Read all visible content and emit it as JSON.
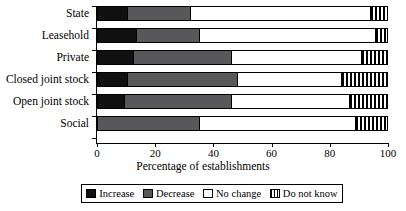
{
  "chart_data": {
    "type": "bar",
    "orientation": "horizontal",
    "stacked": true,
    "normalized": true,
    "title": "",
    "xlabel": "Percentage of establishments",
    "ylabel": "",
    "xlim": [
      0,
      100
    ],
    "xticks": [
      0,
      20,
      40,
      60,
      80,
      100
    ],
    "grid": false,
    "legend_position": "bottom",
    "categories": [
      "State",
      "Leasehold",
      "Private",
      "Closed joint stock",
      "Open joint stock",
      "Social"
    ],
    "series": [
      {
        "name": "Increase",
        "color": "#101010",
        "pattern": "solid-black",
        "values": [
          10,
          13,
          12,
          10,
          9,
          0
        ]
      },
      {
        "name": "Decrease",
        "color": "#58585a",
        "pattern": "solid-gray",
        "values": [
          22,
          22,
          34,
          38,
          37,
          35
        ]
      },
      {
        "name": "No change",
        "color": "#ffffff",
        "pattern": "solid-white",
        "values": [
          62,
          61,
          45,
          36,
          41,
          54
        ]
      },
      {
        "name": "Do not know",
        "color": "#ffffff",
        "pattern": "vertical-stripes",
        "values": [
          6,
          4,
          9,
          16,
          13,
          11
        ]
      }
    ]
  },
  "axis": {
    "tick_labels": [
      "0",
      "20",
      "40",
      "60",
      "80",
      "100"
    ],
    "title": "Percentage of establishments"
  },
  "legend": {
    "items": [
      {
        "label": "Increase",
        "swatch": "swatch-increase-icon"
      },
      {
        "label": "Decrease",
        "swatch": "swatch-decrease-icon"
      },
      {
        "label": "No change",
        "swatch": "swatch-nochange-icon"
      },
      {
        "label": "Do not know",
        "swatch": "swatch-dontknow-icon"
      }
    ]
  }
}
